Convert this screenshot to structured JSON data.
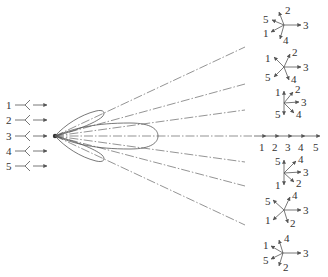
{
  "figure": {
    "colors": {
      "line": "#555555",
      "text": "#333333",
      "background": "#ffffff"
    }
  },
  "inputs": {
    "labels": [
      "1",
      "2",
      "3",
      "4",
      "5"
    ]
  },
  "axis_output": {
    "labels": [
      "1",
      "2",
      "3",
      "4",
      "5"
    ]
  },
  "phasors": [
    {
      "position": "top-1",
      "labels": {
        "a": "5",
        "b": "2",
        "c": "3",
        "d": "1",
        "e": "4"
      }
    },
    {
      "position": "top-2",
      "labels": {
        "a": "1",
        "b": "2",
        "c": "3",
        "d": "5",
        "e": "4"
      }
    },
    {
      "position": "top-3",
      "labels": {
        "a": "1",
        "b": "2",
        "c": "3",
        "d": "5",
        "e": "4"
      }
    },
    {
      "position": "bottom-1",
      "labels": {
        "a": "5",
        "b": "4",
        "c": "3",
        "d": "1",
        "e": "2"
      }
    },
    {
      "position": "bottom-2",
      "labels": {
        "a": "5",
        "b": "4",
        "c": "3",
        "d": "1",
        "e": "2"
      }
    },
    {
      "position": "bottom-3",
      "labels": {
        "a": "1",
        "b": "4",
        "c": "3",
        "d": "5",
        "e": "2"
      }
    }
  ]
}
